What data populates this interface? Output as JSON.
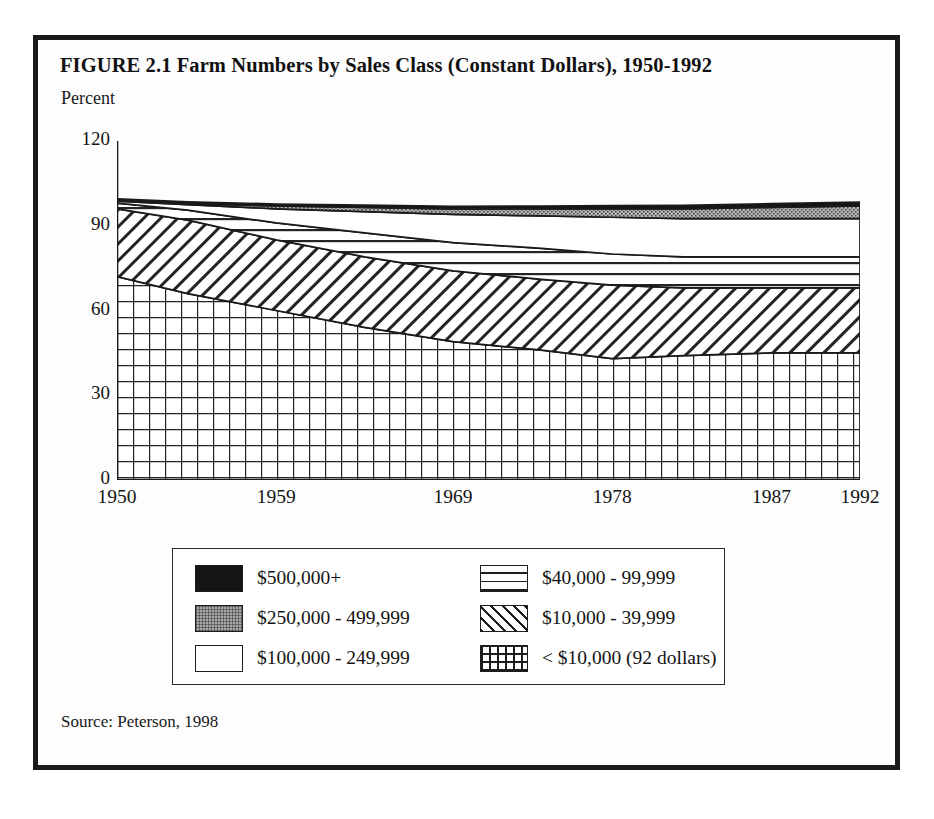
{
  "figure": {
    "title": "FIGURE 2.1  Farm Numbers by Sales Class (Constant Dollars), 1950-1992",
    "source": "Source: Peterson, 1998",
    "unit_label": "Percent"
  },
  "chart_data": {
    "type": "area",
    "title": "FIGURE 2.1  Farm Numbers by Sales Class (Constant Dollars), 1950-1992",
    "xlabel": "",
    "ylabel": "Percent",
    "ylim": [
      0,
      120
    ],
    "xlim": [
      1950,
      1992
    ],
    "yticks": [
      0,
      30,
      60,
      90,
      120
    ],
    "xticks": [
      1950,
      1959,
      1969,
      1978,
      1987,
      1992
    ],
    "grid": false,
    "legend_position": "below-plot",
    "stacked": true,
    "stack_order_bottom_to_top": [
      "< $10,000 (92 dollars)",
      "$10,000 - 39,999",
      "$40,000 - 99,999",
      "$100,000 - 249,999",
      "$250,000 - 499,999",
      "$500,000+"
    ],
    "x": [
      1950,
      1954,
      1959,
      1964,
      1969,
      1974,
      1978,
      1982,
      1987,
      1992
    ],
    "series": [
      {
        "name": "< $10,000 (92 dollars)",
        "pattern": "grid",
        "values": [
          72,
          66,
          60,
          54,
          49,
          46,
          43,
          44,
          45,
          45
        ]
      },
      {
        "name": "$10,000 - 39,999",
        "pattern": "diagonal-hatch",
        "values": [
          24,
          26,
          25,
          25,
          25,
          25,
          26,
          24,
          23,
          23
        ]
      },
      {
        "name": "$40,000 - 99,999",
        "pattern": "horizontal-lines",
        "values": [
          2,
          3.5,
          6,
          8.5,
          10,
          11,
          11,
          11,
          11,
          11
        ]
      },
      {
        "name": "$100,000 - 249,999",
        "pattern": "white",
        "values": [
          0.7,
          2,
          5,
          7.5,
          10,
          11.5,
          13,
          13.5,
          13.5,
          13.5
        ]
      },
      {
        "name": "$250,000 - 499,999",
        "pattern": "gray-stipple",
        "values": [
          0.2,
          0.4,
          1,
          1.5,
          2,
          2.5,
          3,
          3.5,
          4,
          4.5
        ]
      },
      {
        "name": "$500,000+",
        "pattern": "solid-black",
        "values": [
          0.6,
          0.6,
          0.7,
          0.8,
          0.9,
          1.0,
          1.1,
          1.2,
          1.3,
          1.4
        ]
      }
    ],
    "cumulative_tops": {
      "< $10,000 (92 dollars)": [
        72,
        66,
        60,
        54,
        49,
        46,
        43,
        44,
        45,
        45
      ],
      "$10,000 - 39,999": [
        96,
        92,
        85,
        79,
        74,
        71,
        69,
        68,
        68,
        68
      ],
      "$40,000 - 99,999": [
        98,
        95.5,
        91,
        87.5,
        84,
        82,
        80,
        79,
        79,
        79
      ],
      "$100,000 - 249,999": [
        98.7,
        97.5,
        96,
        95,
        94,
        93.5,
        93,
        92.5,
        92.5,
        92.5
      ],
      "$250,000 - 499,999": [
        98.9,
        97.9,
        97,
        96.5,
        96,
        96,
        96,
        96,
        96.5,
        97
      ],
      "$500,000+": [
        99.5,
        98.5,
        97.7,
        97.3,
        96.9,
        97,
        97.1,
        97.2,
        97.8,
        98.4
      ]
    }
  },
  "y_axis": {
    "ticks": [
      {
        "label": "120",
        "value": 120
      },
      {
        "label": "90",
        "value": 90
      },
      {
        "label": "60",
        "value": 60
      },
      {
        "label": "30",
        "value": 30
      },
      {
        "label": "0",
        "value": 0
      }
    ]
  },
  "x_axis": {
    "ticks": [
      {
        "label": "1950",
        "value": 1950
      },
      {
        "label": "1959",
        "value": 1959
      },
      {
        "label": "1969",
        "value": 1969
      },
      {
        "label": "1978",
        "value": 1978
      },
      {
        "label": "1987",
        "value": 1987
      },
      {
        "label": "1992",
        "value": 1992
      }
    ]
  },
  "legend": {
    "left_column": [
      {
        "label": "$500,000+",
        "swatch": "solid-black"
      },
      {
        "label": "$250,000 - 499,999",
        "swatch": "gray-stipple"
      },
      {
        "label": "$100,000 - 249,999",
        "swatch": "white"
      }
    ],
    "right_column": [
      {
        "label": "$40,000 - 99,999",
        "swatch": "horizontal-lines"
      },
      {
        "label": "$10,000 - 39,999",
        "swatch": "diagonal-hatch"
      },
      {
        "label": "< $10,000 (92 dollars)",
        "swatch": "grid"
      }
    ]
  },
  "colors": {
    "frame": "#1b1b1b",
    "ink": "#131313",
    "black_band": "#151515",
    "gray_band": "#a8a8a8",
    "paper": "#ffffff"
  }
}
